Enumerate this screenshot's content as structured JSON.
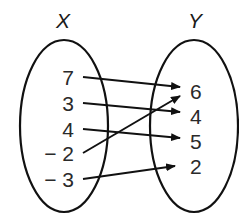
{
  "diagram": {
    "type": "mapping",
    "domain_label": "X",
    "range_label": "Y",
    "domain": [
      {
        "id": "x1",
        "label": "7",
        "x": 74,
        "y": 85
      },
      {
        "id": "x2",
        "label": "3",
        "x": 74,
        "y": 111
      },
      {
        "id": "x3",
        "label": "4",
        "x": 74,
        "y": 137
      },
      {
        "id": "x4",
        "label": "− 2",
        "x": 74,
        "y": 161
      },
      {
        "id": "x5",
        "label": "− 3",
        "x": 74,
        "y": 187
      }
    ],
    "range": [
      {
        "id": "y1",
        "label": "6",
        "x": 190,
        "y": 99
      },
      {
        "id": "y2",
        "label": "4",
        "x": 190,
        "y": 124
      },
      {
        "id": "y3",
        "label": "5",
        "x": 190,
        "y": 149
      },
      {
        "id": "y4",
        "label": "2",
        "x": 190,
        "y": 174
      }
    ],
    "mappings": [
      {
        "from": "7",
        "to": "6",
        "x1": 83,
        "y1": 77,
        "x2": 180,
        "y2": 87
      },
      {
        "from": "3",
        "to": "4",
        "x1": 83,
        "y1": 103,
        "x2": 180,
        "y2": 112
      },
      {
        "from": "4",
        "to": "5",
        "x1": 83,
        "y1": 129,
        "x2": 180,
        "y2": 138
      },
      {
        "from": "-2",
        "to": "6",
        "x1": 83,
        "y1": 153,
        "x2": 180,
        "y2": 96
      },
      {
        "from": "-3",
        "to": "2",
        "x1": 83,
        "y1": 179,
        "x2": 175,
        "y2": 166
      }
    ]
  }
}
